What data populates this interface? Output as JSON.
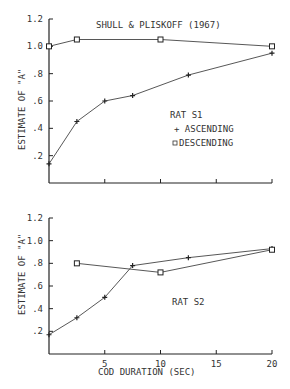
{
  "chart_data": [
    {
      "type": "line",
      "title": "SHULL & PLISKOFF (1967)",
      "panel_label": "RAT S1",
      "xlabel": "",
      "ylabel": "ESTIMATE OF \"A\"",
      "xlim": [
        0,
        20
      ],
      "ylim": [
        0,
        1.2
      ],
      "yticks": [
        ".2",
        ".4",
        ".6",
        ".8",
        "1.0",
        "1.2"
      ],
      "xticks": [
        5,
        10,
        15,
        20
      ],
      "legend": [
        {
          "marker": "+",
          "label": "ASCENDING"
        },
        {
          "marker": "square",
          "label": "DESCENDING"
        }
      ],
      "series": [
        {
          "name": "ASCENDING",
          "x": [
            0,
            2.5,
            5,
            7.5,
            12.5,
            20
          ],
          "values": [
            0.14,
            0.45,
            0.6,
            0.64,
            0.79,
            0.95
          ]
        },
        {
          "name": "DESCENDING",
          "x": [
            0,
            2.5,
            10,
            20
          ],
          "values": [
            1.0,
            1.05,
            1.05,
            1.0
          ]
        }
      ]
    },
    {
      "type": "line",
      "title": "",
      "panel_label": "RAT S2",
      "xlabel": "COD DURATION (SEC)",
      "ylabel": "ESTIMATE OF \"A\"",
      "xlim": [
        0,
        20
      ],
      "ylim": [
        0,
        1.2
      ],
      "yticks": [
        ".2",
        ".4",
        ".6",
        ".8",
        "1.0",
        "1.2"
      ],
      "xticks": [
        5,
        10,
        15,
        20
      ],
      "series": [
        {
          "name": "ASCENDING",
          "x": [
            0,
            2.5,
            5,
            7.5,
            12.5,
            20
          ],
          "values": [
            0.17,
            0.32,
            0.5,
            0.78,
            0.85,
            0.93
          ]
        },
        {
          "name": "DESCENDING",
          "x": [
            2.5,
            10,
            20
          ],
          "values": [
            0.8,
            0.72,
            0.92
          ]
        }
      ]
    }
  ],
  "labels": {
    "title": "SHULL & PLISKOFF (1967)",
    "rat1": "RAT S1",
    "rat2": "RAT S2",
    "asc": "+ ASCENDING",
    "desc": "DESCENDING",
    "ylabel": "ESTIMATE OF \"A\"",
    "xlabel": "COD DURATION (SEC)"
  }
}
